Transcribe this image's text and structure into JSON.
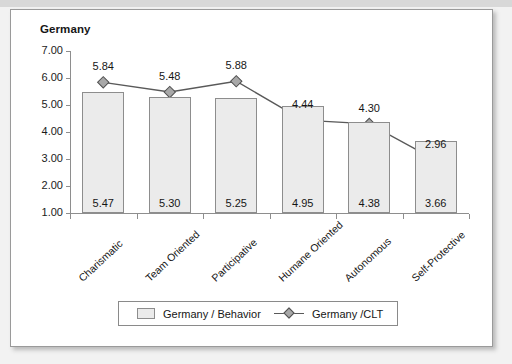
{
  "chart_data": {
    "type": "bar",
    "title": "Germany",
    "xlabel": "",
    "ylabel": "",
    "ylim": [
      1.0,
      7.0
    ],
    "ytick_step": 1.0,
    "yticks": [
      "7.00",
      "6.00",
      "5.00",
      "4.00",
      "3.00",
      "2.00",
      "1.00"
    ],
    "grid": false,
    "legend_position": "bottom-center",
    "categories": [
      "Charismatic",
      "Team Oriented",
      "Participative",
      "Humane Oriented",
      "Autonomous",
      "Self-Protective"
    ],
    "series": [
      {
        "name": "Germany / Behavior",
        "type": "bar",
        "values": [
          5.47,
          5.3,
          5.25,
          4.95,
          4.38,
          3.66
        ],
        "labels": [
          "5.47",
          "5.30",
          "5.25",
          "4.95",
          "4.38",
          "3.66"
        ],
        "label_position": "inside-bottom",
        "fill_color": "#ebebeb",
        "border_color": "#8d8d8d"
      },
      {
        "name": "Germany /CLT",
        "type": "line",
        "values": [
          5.84,
          5.48,
          5.88,
          4.44,
          4.3,
          2.96
        ],
        "labels": [
          "5.84",
          "5.48",
          "5.88",
          "4.44",
          "4.30",
          "2.96"
        ],
        "label_position": "above",
        "line_color": "#595959",
        "marker": "diamond",
        "marker_color": "#a8a8a8"
      }
    ]
  },
  "legend": {
    "items": [
      {
        "label": "Germany / Behavior",
        "marker": "bar-swatch"
      },
      {
        "label": "Germany /CLT",
        "marker": "line-diamond"
      }
    ]
  },
  "colors": {
    "card_background": "#ffffff",
    "page_background": "#f2f2f2",
    "axis": "#8e8e8e",
    "text": "#161616"
  }
}
